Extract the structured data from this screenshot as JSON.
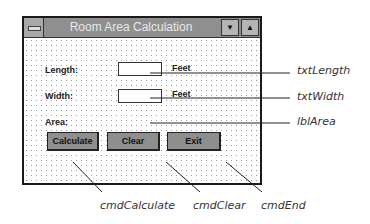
{
  "window": {
    "title": "Room Area Calculation",
    "sysmenu_icon": "system-menu-icon",
    "minimize_icon": "down-triangle-icon",
    "maximize_icon": "up-triangle-icon",
    "minimize_glyph": "▼",
    "maximize_glyph": "▲"
  },
  "form": {
    "length_label": "Length:",
    "length_value": "",
    "length_unit": "Feet",
    "width_label": "Width:",
    "width_value": "",
    "width_unit": "Feet",
    "area_label": "Area:",
    "area_value": ""
  },
  "buttons": {
    "calculate": "Calculate",
    "clear": "Clear",
    "exit": "Exit"
  },
  "callouts": {
    "txt_length": "txtLength",
    "txt_width": "txtWidth",
    "lbl_area": "lblArea",
    "cmd_calculate": "cmdCalculate",
    "cmd_clear": "cmdClear",
    "cmd_end": "cmdEnd"
  }
}
